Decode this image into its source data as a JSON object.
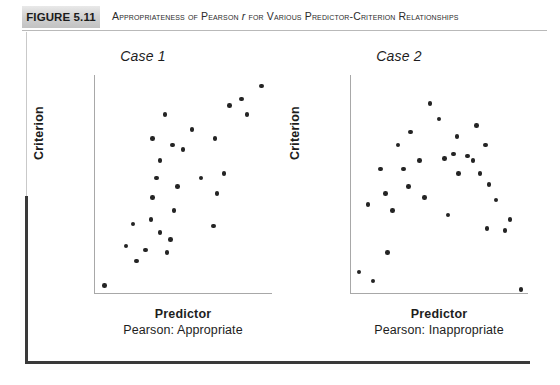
{
  "header": {
    "figure_number": "FIGURE 5.11",
    "title_prefix": "Appropriateness of Pearson ",
    "title_italic": "r",
    "title_suffix": " for Various Predictor-Criterion Relationships"
  },
  "chart_data": [
    {
      "type": "scatter",
      "title": "Case 1",
      "xlabel": "Predictor",
      "ylabel": "Criterion",
      "caption": "Pearson: Appropriate",
      "xlim": [
        0,
        100
      ],
      "ylim": [
        0,
        100
      ],
      "grid": false,
      "legend": "none",
      "points": [
        {
          "x": 6,
          "y": 4
        },
        {
          "x": 18,
          "y": 22
        },
        {
          "x": 24,
          "y": 15
        },
        {
          "x": 29,
          "y": 20
        },
        {
          "x": 22,
          "y": 32
        },
        {
          "x": 32,
          "y": 34
        },
        {
          "x": 37,
          "y": 28
        },
        {
          "x": 41,
          "y": 19
        },
        {
          "x": 43,
          "y": 25
        },
        {
          "x": 33,
          "y": 44
        },
        {
          "x": 35,
          "y": 53
        },
        {
          "x": 45,
          "y": 38
        },
        {
          "x": 47,
          "y": 49
        },
        {
          "x": 37,
          "y": 61
        },
        {
          "x": 33,
          "y": 71
        },
        {
          "x": 44,
          "y": 68
        },
        {
          "x": 50,
          "y": 66
        },
        {
          "x": 40,
          "y": 82
        },
        {
          "x": 55,
          "y": 75
        },
        {
          "x": 60,
          "y": 53
        },
        {
          "x": 67,
          "y": 31
        },
        {
          "x": 69,
          "y": 46
        },
        {
          "x": 73,
          "y": 55
        },
        {
          "x": 68,
          "y": 71
        },
        {
          "x": 76,
          "y": 86
        },
        {
          "x": 83,
          "y": 89
        },
        {
          "x": 86,
          "y": 82
        },
        {
          "x": 94,
          "y": 95
        }
      ]
    },
    {
      "type": "scatter",
      "title": "Case 2",
      "xlabel": "Predictor",
      "ylabel": "Criterion",
      "caption": "Pearson: Inappropriate",
      "xlim": [
        0,
        100
      ],
      "ylim": [
        0,
        100
      ],
      "grid": false,
      "legend": "none",
      "points": [
        {
          "x": 5,
          "y": 10
        },
        {
          "x": 13,
          "y": 6
        },
        {
          "x": 10,
          "y": 41
        },
        {
          "x": 21,
          "y": 19
        },
        {
          "x": 20,
          "y": 46
        },
        {
          "x": 17,
          "y": 57
        },
        {
          "x": 24,
          "y": 38
        },
        {
          "x": 27,
          "y": 68
        },
        {
          "x": 30,
          "y": 57
        },
        {
          "x": 34,
          "y": 74
        },
        {
          "x": 39,
          "y": 61
        },
        {
          "x": 33,
          "y": 49
        },
        {
          "x": 45,
          "y": 87
        },
        {
          "x": 42,
          "y": 44
        },
        {
          "x": 50,
          "y": 80
        },
        {
          "x": 53,
          "y": 62
        },
        {
          "x": 58,
          "y": 64
        },
        {
          "x": 60,
          "y": 72
        },
        {
          "x": 61,
          "y": 55
        },
        {
          "x": 66,
          "y": 63
        },
        {
          "x": 55,
          "y": 36
        },
        {
          "x": 71,
          "y": 77
        },
        {
          "x": 69,
          "y": 61
        },
        {
          "x": 73,
          "y": 55
        },
        {
          "x": 76,
          "y": 68
        },
        {
          "x": 78,
          "y": 50
        },
        {
          "x": 82,
          "y": 43
        },
        {
          "x": 77,
          "y": 30
        },
        {
          "x": 87,
          "y": 29
        },
        {
          "x": 90,
          "y": 34
        },
        {
          "x": 96,
          "y": 2
        }
      ]
    }
  ]
}
